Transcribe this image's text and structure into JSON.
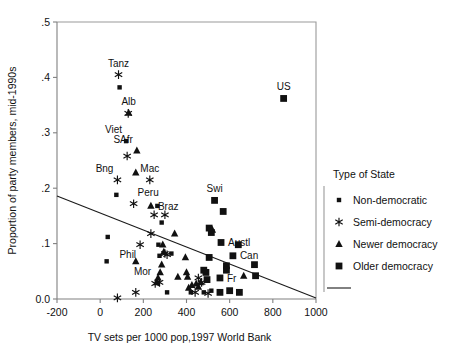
{
  "chart_data": {
    "type": "scatter",
    "title": "",
    "xlabel": "TV sets per 1000  pop,1997 World Bank",
    "ylabel": "Proportion of party members, mid-1990s",
    "xlim": [
      -200,
      1000
    ],
    "ylim": [
      0.0,
      0.5
    ],
    "xticks": [
      -200,
      0,
      200,
      400,
      600,
      800,
      1000
    ],
    "xticklabels": [
      "-200",
      "0",
      "200",
      "400",
      "600",
      "800",
      "1000"
    ],
    "yticks": [
      0.0,
      0.1,
      0.2,
      0.3,
      0.4,
      0.5
    ],
    "yticklabels": [
      "0.0",
      ".1",
      ".2",
      ".3",
      ".4",
      ".5"
    ],
    "grid": false,
    "legend_position": "right",
    "legend_title": "Type of State",
    "series": [
      {
        "name": "Non-democratic",
        "marker": "small-square",
        "points": [
          {
            "x": 90,
            "y": 0.382
          },
          {
            "x": 120,
            "y": 0.285,
            "label": "Viet",
            "label_pos": "above-left"
          },
          {
            "x": 75,
            "y": 0.188
          },
          {
            "x": 35,
            "y": 0.112
          },
          {
            "x": 30,
            "y": 0.068
          },
          {
            "x": 265,
            "y": 0.168
          },
          {
            "x": 285,
            "y": 0.138
          },
          {
            "x": 270,
            "y": 0.098
          },
          {
            "x": 275,
            "y": 0.078
          },
          {
            "x": 310,
            "y": 0.012
          },
          {
            "x": 330,
            "y": 0.082
          },
          {
            "x": 420,
            "y": 0.012
          },
          {
            "x": 480,
            "y": 0.012
          },
          {
            "x": 515,
            "y": 0.015
          }
        ]
      },
      {
        "name": "Semi-democracy",
        "marker": "star",
        "points": [
          {
            "x": 85,
            "y": 0.405,
            "label": "Tanz",
            "label_pos": "above"
          },
          {
            "x": 130,
            "y": 0.335
          },
          {
            "x": 125,
            "y": 0.258
          },
          {
            "x": 80,
            "y": 0.215,
            "label": "Bng",
            "label_pos": "above-left"
          },
          {
            "x": 230,
            "y": 0.215,
            "label": "Mac",
            "label_pos": "above"
          },
          {
            "x": 155,
            "y": 0.172,
            "label": "Peru",
            "label_pos": "above-right"
          },
          {
            "x": 250,
            "y": 0.152
          },
          {
            "x": 300,
            "y": 0.152
          },
          {
            "x": 235,
            "y": 0.118
          },
          {
            "x": 185,
            "y": 0.098,
            "label": "Phil",
            "label_pos": "below-left"
          },
          {
            "x": 300,
            "y": 0.082
          },
          {
            "x": 310,
            "y": 0.08
          },
          {
            "x": 255,
            "y": 0.028,
            "label": "Mor",
            "label_pos": "above-left"
          },
          {
            "x": 275,
            "y": 0.03
          },
          {
            "x": 80,
            "y": 0.002
          },
          {
            "x": 455,
            "y": 0.038
          },
          {
            "x": 470,
            "y": 0.03
          },
          {
            "x": 440,
            "y": 0.012
          },
          {
            "x": 500,
            "y": 0.01
          },
          {
            "x": 165,
            "y": 0.012
          }
        ]
      },
      {
        "name": "Newer democracy",
        "marker": "triangle",
        "points": [
          {
            "x": 132,
            "y": 0.336,
            "label": "Alb",
            "label_pos": "above"
          },
          {
            "x": 170,
            "y": 0.268,
            "label": "SAfr",
            "label_pos": "above-left"
          },
          {
            "x": 165,
            "y": 0.228
          },
          {
            "x": 235,
            "y": 0.168,
            "label": "Braz",
            "label_pos": "right"
          },
          {
            "x": 345,
            "y": 0.118
          },
          {
            "x": 165,
            "y": 0.068
          },
          {
            "x": 290,
            "y": 0.098
          },
          {
            "x": 295,
            "y": 0.085
          },
          {
            "x": 285,
            "y": 0.062
          },
          {
            "x": 278,
            "y": 0.048
          },
          {
            "x": 268,
            "y": 0.038
          },
          {
            "x": 262,
            "y": 0.03
          },
          {
            "x": 360,
            "y": 0.04
          },
          {
            "x": 395,
            "y": 0.075
          },
          {
            "x": 400,
            "y": 0.048
          },
          {
            "x": 405,
            "y": 0.04
          },
          {
            "x": 410,
            "y": 0.02
          },
          {
            "x": 425,
            "y": 0.025
          },
          {
            "x": 445,
            "y": 0.028
          },
          {
            "x": 455,
            "y": 0.022
          },
          {
            "x": 465,
            "y": 0.03
          },
          {
            "x": 520,
            "y": 0.125
          },
          {
            "x": 665,
            "y": 0.042
          }
        ]
      },
      {
        "name": "Older democracy",
        "marker": "big-square",
        "points": [
          {
            "x": 850,
            "y": 0.362,
            "label": "US",
            "label_pos": "above"
          },
          {
            "x": 530,
            "y": 0.178,
            "label": "Swi",
            "label_pos": "above"
          },
          {
            "x": 570,
            "y": 0.158
          },
          {
            "x": 505,
            "y": 0.128
          },
          {
            "x": 515,
            "y": 0.12
          },
          {
            "x": 560,
            "y": 0.102,
            "label": "Austl",
            "label_pos": "right"
          },
          {
            "x": 640,
            "y": 0.098
          },
          {
            "x": 615,
            "y": 0.078,
            "label": "Can",
            "label_pos": "right"
          },
          {
            "x": 505,
            "y": 0.075
          },
          {
            "x": 585,
            "y": 0.06
          },
          {
            "x": 585,
            "y": 0.052
          },
          {
            "x": 715,
            "y": 0.062
          },
          {
            "x": 720,
            "y": 0.042
          },
          {
            "x": 555,
            "y": 0.038,
            "label": "Fr",
            "label_pos": "right"
          },
          {
            "x": 490,
            "y": 0.048
          },
          {
            "x": 480,
            "y": 0.052
          },
          {
            "x": 495,
            "y": 0.035
          },
          {
            "x": 555,
            "y": 0.012
          },
          {
            "x": 600,
            "y": 0.015
          },
          {
            "x": 645,
            "y": 0.012
          }
        ]
      }
    ],
    "trendline": {
      "x0": -200,
      "y0": 0.186,
      "x1": 1000,
      "y1": 0.002
    }
  },
  "legend": {
    "title": "Type of State",
    "items": [
      {
        "label": "Non-democratic",
        "marker": "small-square"
      },
      {
        "label": "Semi-democracy",
        "marker": "star"
      },
      {
        "label": "Newer democracy",
        "marker": "triangle"
      },
      {
        "label": "Older democracy",
        "marker": "big-square"
      },
      {
        "label": "",
        "marker": "line"
      }
    ]
  }
}
